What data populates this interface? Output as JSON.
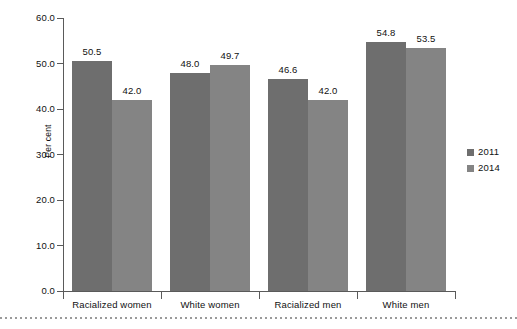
{
  "chart_data": {
    "type": "bar",
    "title": "",
    "subtitle": "",
    "xlabel": "",
    "ylabel": "Per cent",
    "categories": [
      "Racialized women",
      "White women",
      "Racialized men",
      "White men"
    ],
    "series": [
      {
        "name": "2011",
        "color": "#6e6e6e",
        "values": [
          50.5,
          48.0,
          46.6,
          54.8
        ]
      },
      {
        "name": "2014",
        "color": "#848484",
        "values": [
          42.0,
          49.7,
          42.0,
          53.5
        ]
      }
    ],
    "value_labels": [
      [
        "50.5",
        "42.0"
      ],
      [
        "48.0",
        "49.7"
      ],
      [
        "46.6",
        "42.0"
      ],
      [
        "54.8",
        "53.5"
      ]
    ],
    "ylim": [
      0.0,
      60.0
    ],
    "ytick_step": 10.0,
    "ytick_labels": [
      "60.0",
      "50.0",
      "40.0",
      "30.0",
      "20.0",
      "10.0",
      "0.0"
    ],
    "ytick_values": [
      60.0,
      50.0,
      40.0,
      30.0,
      20.0,
      10.0,
      0.0
    ],
    "grid": false,
    "legend_position": "right",
    "legend_entries": [
      "2011",
      "2014"
    ],
    "axis_color": "#5a5a5a",
    "background_color": "#ffffff"
  },
  "axis": {
    "y_title": "Per cent"
  },
  "legend": {
    "items": [
      {
        "label": "2011"
      },
      {
        "label": "2014"
      }
    ]
  }
}
